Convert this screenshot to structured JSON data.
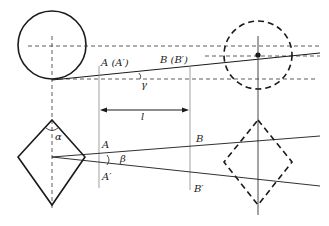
{
  "diagram": {
    "type": "geometry-optics-schematic",
    "colors": {
      "stroke": "#1a1a1a",
      "thin": "#555555",
      "background": "#ffffff"
    },
    "top_view": {
      "labels": {
        "A_pair": "A (A′)",
        "B_pair": "B (B′)",
        "gamma": "γ",
        "length": "l"
      }
    },
    "bottom_view": {
      "labels": {
        "A": "A",
        "A_prime": "A′",
        "B": "B",
        "B_prime": "B′",
        "beta": "β",
        "alpha": "α"
      }
    }
  }
}
